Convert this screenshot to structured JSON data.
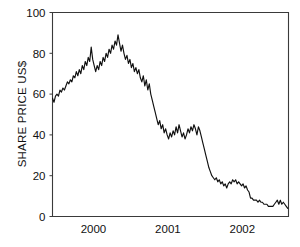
{
  "chart_data": {
    "type": "line",
    "title": "",
    "subtitle": "",
    "xlabel": "",
    "ylabel": "SHARE PRICE US$",
    "ylim": [
      0,
      100
    ],
    "xlim": [
      1999.45,
      2002.62
    ],
    "grid": false,
    "legend": null,
    "y_ticks": [
      0,
      20,
      40,
      60,
      80,
      100
    ],
    "y_tick_labels": [
      "0",
      "20",
      "40",
      "60",
      "80",
      "100"
    ],
    "x_ticks": [
      2000,
      2001,
      2002
    ],
    "x_tick_labels": [
      "2000",
      "2001",
      "2002"
    ],
    "line_color": "#101010",
    "axis_color": "#3a3a3a",
    "background_color": "#ffffff",
    "series": [
      {
        "name": "Share price",
        "x": [
          1999.45,
          1999.47,
          1999.49,
          1999.51,
          1999.53,
          1999.55,
          1999.57,
          1999.59,
          1999.61,
          1999.63,
          1999.65,
          1999.67,
          1999.69,
          1999.71,
          1999.73,
          1999.75,
          1999.77,
          1999.79,
          1999.81,
          1999.83,
          1999.85,
          1999.87,
          1999.89,
          1999.91,
          1999.93,
          1999.95,
          1999.97,
          1999.99,
          2000.01,
          2000.03,
          2000.05,
          2000.07,
          2000.09,
          2000.11,
          2000.13,
          2000.15,
          2000.17,
          2000.19,
          2000.21,
          2000.23,
          2000.25,
          2000.27,
          2000.29,
          2000.31,
          2000.33,
          2000.35,
          2000.37,
          2000.39,
          2000.41,
          2000.43,
          2000.45,
          2000.47,
          2000.49,
          2000.51,
          2000.53,
          2000.55,
          2000.57,
          2000.59,
          2000.61,
          2000.63,
          2000.65,
          2000.67,
          2000.69,
          2000.71,
          2000.73,
          2000.75,
          2000.77,
          2000.79,
          2000.81,
          2000.83,
          2000.85,
          2000.87,
          2000.89,
          2000.91,
          2000.93,
          2000.95,
          2000.97,
          2000.99,
          2001.01,
          2001.03,
          2001.05,
          2001.07,
          2001.09,
          2001.11,
          2001.13,
          2001.15,
          2001.17,
          2001.19,
          2001.21,
          2001.23,
          2001.25,
          2001.27,
          2001.29,
          2001.31,
          2001.33,
          2001.35,
          2001.37,
          2001.39,
          2001.41,
          2001.43,
          2001.45,
          2001.47,
          2001.49,
          2001.51,
          2001.53,
          2001.55,
          2001.57,
          2001.59,
          2001.61,
          2001.63,
          2001.65,
          2001.67,
          2001.69,
          2001.71,
          2001.73,
          2001.75,
          2001.77,
          2001.79,
          2001.81,
          2001.83,
          2001.85,
          2001.87,
          2001.89,
          2001.91,
          2001.93,
          2001.95,
          2001.97,
          2001.99,
          2002.01,
          2002.03,
          2002.05,
          2002.07,
          2002.09,
          2002.11,
          2002.13,
          2002.15,
          2002.17,
          2002.19,
          2002.21,
          2002.23,
          2002.25,
          2002.27,
          2002.29,
          2002.31,
          2002.33,
          2002.35,
          2002.37,
          2002.39,
          2002.41,
          2002.43,
          2002.45,
          2002.47,
          2002.49,
          2002.51,
          2002.53,
          2002.55,
          2002.57,
          2002.59,
          2002.61
        ],
        "values": [
          58,
          56,
          59,
          60,
          59,
          62,
          61,
          63,
          62,
          64,
          66,
          65,
          67,
          66,
          69,
          68,
          71,
          69,
          72,
          70,
          74,
          72,
          76,
          74,
          78,
          76,
          83,
          77,
          74,
          71,
          74,
          72,
          76,
          74,
          78,
          76,
          80,
          78,
          82,
          80,
          84,
          82,
          86,
          84,
          89,
          85,
          81,
          84,
          80,
          77,
          79,
          75,
          77,
          73,
          75,
          71,
          73,
          70,
          72,
          68,
          66,
          69,
          64,
          67,
          62,
          65,
          60,
          57,
          54,
          51,
          48,
          45,
          47,
          43,
          45,
          41,
          43,
          40,
          38,
          41,
          39,
          42,
          40,
          44,
          41,
          45,
          42,
          39,
          41,
          38,
          40,
          43,
          41,
          44,
          42,
          45,
          43,
          40,
          44,
          42,
          39,
          36,
          33,
          30,
          27,
          24,
          22,
          20,
          19,
          18,
          19,
          17,
          18,
          16,
          17,
          15,
          16,
          14,
          16,
          17,
          16,
          18,
          17,
          18,
          16,
          17,
          16,
          15,
          16,
          14,
          15,
          13,
          12,
          9,
          9,
          8,
          8,
          8,
          7,
          8,
          7,
          7,
          6,
          6,
          6,
          5,
          5,
          5,
          5,
          6,
          7,
          8,
          6,
          8,
          6,
          7,
          6,
          5,
          4
        ]
      }
    ]
  },
  "axes": {
    "ylabel_text": "SHARE PRICE US$"
  }
}
